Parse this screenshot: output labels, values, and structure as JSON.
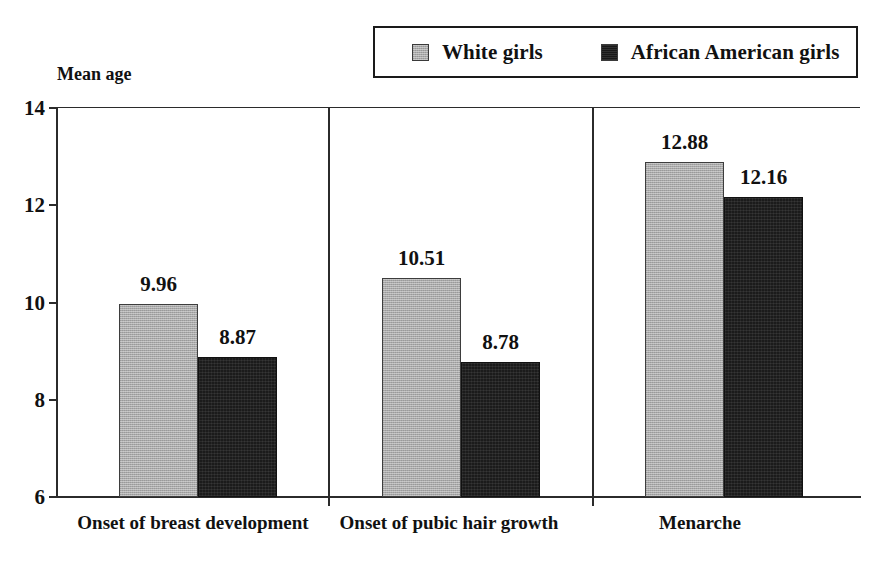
{
  "axis_title": "Mean age",
  "legend": {
    "entries": [
      {
        "label": "White girls",
        "swatch": "gray-swatch-icon",
        "color": "#a9a9a9"
      },
      {
        "label": "African American girls",
        "swatch": "black-swatch-icon",
        "color": "#1b1b1b"
      }
    ]
  },
  "y_ticks": [
    {
      "label": "14",
      "value": 14
    },
    {
      "label": "12",
      "value": 12
    },
    {
      "label": "10",
      "value": 10
    },
    {
      "label": "8",
      "value": 8
    },
    {
      "label": "6",
      "value": 6
    }
  ],
  "panels": [
    {
      "category": "Onset of breast development",
      "bars": [
        {
          "series": "White girls",
          "value": 9.96,
          "label": "9.96"
        },
        {
          "series": "African American girls",
          "value": 8.87,
          "label": "8.87"
        }
      ]
    },
    {
      "category": "Onset of pubic hair growth",
      "bars": [
        {
          "series": "White girls",
          "value": 10.51,
          "label": "10.51"
        },
        {
          "series": "African American girls",
          "value": 8.78,
          "label": "8.78"
        }
      ]
    },
    {
      "category": "Menarche",
      "bars": [
        {
          "series": "White girls",
          "value": 12.88,
          "label": "12.88"
        },
        {
          "series": "African American girls",
          "value": 12.16,
          "label": "12.16"
        }
      ]
    }
  ],
  "chart_data": {
    "type": "bar",
    "title": "",
    "subtitle": "",
    "xlabel": "",
    "ylabel": "Mean age",
    "ylim": [
      6,
      14
    ],
    "yticks": [
      6,
      8,
      10,
      12,
      14
    ],
    "grid": false,
    "legend_position": "top-right",
    "categories": [
      "Onset of breast development",
      "Onset of pubic hair growth",
      "Menarche"
    ],
    "series": [
      {
        "name": "White girls",
        "color": "#a9a9a9",
        "values": [
          9.96,
          10.51,
          12.88
        ]
      },
      {
        "name": "African American girls",
        "color": "#1b1b1b",
        "values": [
          8.87,
          8.78,
          12.16
        ]
      }
    ],
    "data_labels": [
      [
        "9.96",
        "10.51",
        "12.88"
      ],
      [
        "8.87",
        "8.78",
        "12.16"
      ]
    ]
  }
}
